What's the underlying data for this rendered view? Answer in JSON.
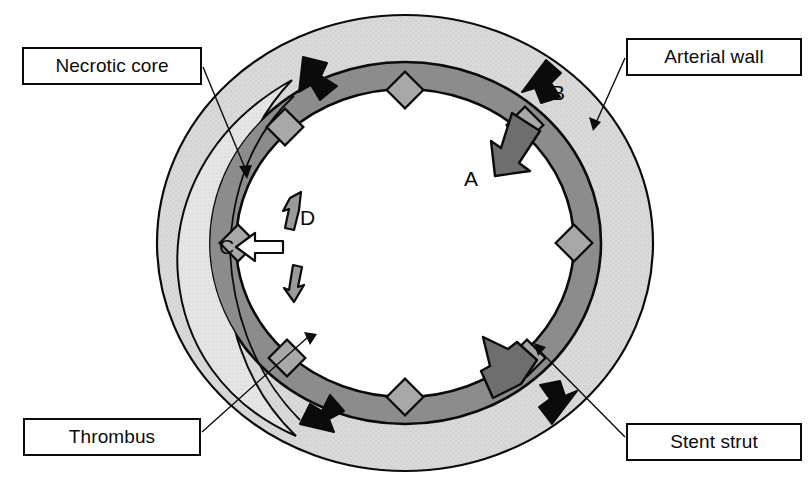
{
  "figure": {
    "type": "anatomical-diagram",
    "width": 809,
    "height": 489,
    "background_color": "#ffffff"
  },
  "callouts": [
    {
      "id": "necrotic-core",
      "label": "Necrotic core",
      "position": "top-left",
      "leader_target": "stippled crescent region inside arterial wall, left side"
    },
    {
      "id": "arterial-wall",
      "label": "Arterial wall",
      "position": "top-right",
      "leader_target": "outer light gray band of the vessel"
    },
    {
      "id": "thrombus",
      "label": "Thrombus",
      "position": "bottom-left",
      "leader_target": "medium gray inner ring lining the lumen"
    },
    {
      "id": "stent-strut",
      "label": "Stent strut",
      "position": "bottom-right",
      "leader_target": "diamond shape embedded at inner ring boundary"
    }
  ],
  "markers": [
    {
      "id": "a",
      "label": "A",
      "arrow_style": "solid-gray",
      "direction": "inward toward lumen",
      "location": "upper-right quadrant"
    },
    {
      "id": "b",
      "label": "B",
      "arrow_style": "solid-black",
      "direction": "inward toward lumen",
      "location": "upper-right, within arterial wall"
    },
    {
      "id": "c",
      "label": "C",
      "arrow_style": "hollow-white",
      "direction": "outward away from lumen",
      "location": "left side, crossing into necrotic core"
    },
    {
      "id": "d",
      "label": "D",
      "arrow_style": "hollow-gray-pair",
      "direction": "circumferential, both directions along wall",
      "location": "left side, above and below a stent strut"
    }
  ],
  "layers": [
    {
      "id": "arterial-wall",
      "name": "Arterial wall",
      "fill": "#d9d9d9",
      "texture": "stippled"
    },
    {
      "id": "necrotic-core",
      "name": "Necrotic core",
      "fill": "#e3e3e3",
      "texture": "fine-stipple"
    },
    {
      "id": "thrombus",
      "name": "Thrombus",
      "fill": "#8c8c8c",
      "texture": "solid"
    },
    {
      "id": "lumen",
      "name": "Lumen",
      "fill": "#ffffff",
      "texture": "none"
    },
    {
      "id": "stent-strut",
      "name": "Stent strut",
      "fill": "#a8a8a8",
      "texture": "solid"
    }
  ],
  "geometry": {
    "center": {
      "x": 405,
      "y": 243
    },
    "outer_wall_radii": {
      "rx": 248,
      "ry": 228
    },
    "inner_wall_radii": {
      "rx": 196,
      "ry": 181
    },
    "thrombus_outer": {
      "rx": 196,
      "ry": 181
    },
    "thrombus_inner": {
      "rx": 169,
      "ry": 154
    },
    "stent_strut_count": 8,
    "stroke_color": "#0b0b0b"
  },
  "colors": {
    "outline": "#0b0b0b",
    "arterial_wall": "#d9d9d9",
    "necrotic_core": "#e3e3e3",
    "thrombus": "#8c8c8c",
    "stent_strut": "#a8a8a8",
    "lumen": "#ffffff",
    "arrow_black": "#0b0b0b",
    "arrow_gray": "#6e6e6e",
    "arrow_white": "#ffffff"
  },
  "inward_arrows": [
    {
      "id": "nw",
      "style": "solid-black",
      "location": "upper-left"
    },
    {
      "id": "ne",
      "style": "solid-black",
      "location": "upper-right (marker B)"
    },
    {
      "id": "sw",
      "style": "solid-black",
      "location": "lower-left"
    },
    {
      "id": "se",
      "style": "solid-black",
      "location": "lower-right"
    },
    {
      "id": "a-gray",
      "style": "solid-gray",
      "location": "upper-right (marker A)"
    },
    {
      "id": "se-gray",
      "style": "solid-gray",
      "location": "lower-right interior"
    }
  ]
}
